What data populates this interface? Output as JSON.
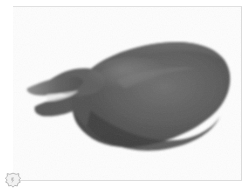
{
  "viewer": {
    "name": "image-viewer",
    "background_color": "#ffffff"
  },
  "frame": {
    "border_color": "#dcdcdc",
    "plate_color": "#fefefe"
  },
  "handle": {
    "icon": "hexagon-flower-handle-icon",
    "color": "#b9b9b9"
  },
  "photo": {
    "alt_text": "Dark bird in profile facing left with open beak",
    "subject": "bird",
    "orientation": "facing-left",
    "palette": {
      "background": "#fdfdfd",
      "body_dark": "#4e4e4e",
      "body_mid": "#5d5d5d",
      "body_light": "#6f6f6f",
      "highlight": "#8a8a8a",
      "shadow": "#3a3a3a",
      "beak": "#606060"
    }
  },
  "image_data": {
    "type": "photograph",
    "colorspace": "grayscale",
    "description": "Side view of a dark gray bird form with a long pointed open beak at left, a rounded back rising toward the right, and a smoothly curved underside."
  }
}
